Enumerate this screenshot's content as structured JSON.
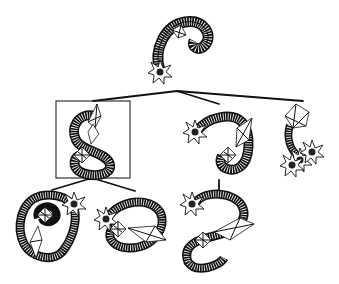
{
  "illustration": {
    "subject": "hanging mobile of spiral shell creatures",
    "ink_color": "#111111",
    "background_color": "#ffffff",
    "creature_count": 7,
    "highlighted_creature": "middle-left (framed)",
    "creatures": [
      {
        "id": "top",
        "tail": "star-tip",
        "curl": "right"
      },
      {
        "id": "mid-left",
        "tail": "wireframe",
        "curl": "s-shape",
        "framed": true
      },
      {
        "id": "mid-center",
        "tail": "star-tip",
        "curl": "right-down"
      },
      {
        "id": "mid-right",
        "tail": "star-cluster",
        "curl": "short-hook"
      },
      {
        "id": "bottom-left",
        "tail": "star-tip",
        "curl": "spiral"
      },
      {
        "id": "bottom-center",
        "tail": "star-tip",
        "curl": "loop"
      },
      {
        "id": "bottom-right",
        "tail": "star-tip",
        "curl": "c-shape"
      }
    ]
  }
}
